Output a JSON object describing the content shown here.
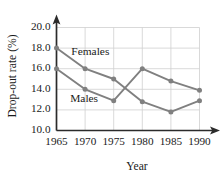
{
  "chart_data": {
    "type": "line",
    "title": "",
    "xlabel": "Year",
    "ylabel": "Drop-out rate (%)",
    "x": [
      1965,
      1970,
      1975,
      1980,
      1985,
      1990
    ],
    "xtick_labels": [
      "1965",
      "1970",
      "1975",
      "1980",
      "1985",
      "1990"
    ],
    "ytick_labels": [
      "10.0",
      "12.0",
      "14.0",
      "16.0",
      "18.0",
      "20.0"
    ],
    "yticks": [
      10.0,
      12.0,
      14.0,
      16.0,
      18.0,
      20.0
    ],
    "xlim": [
      1965,
      1990
    ],
    "ylim": [
      10.0,
      20.0
    ],
    "grid": true,
    "legend_position": "inline-annotations",
    "series": [
      {
        "name": "Females",
        "label": "Females",
        "color": "#808080",
        "values": [
          18.0,
          16.0,
          15.0,
          12.8,
          11.8,
          12.9
        ]
      },
      {
        "name": "Males",
        "label": "Males",
        "color": "#808080",
        "values": [
          16.0,
          14.0,
          12.9,
          16.0,
          14.8,
          13.9
        ]
      }
    ],
    "annotations": [
      {
        "text": "Females",
        "x": 1967.6,
        "y": 17.55
      },
      {
        "text": "Males",
        "x": 1967.4,
        "y": 13.05
      }
    ],
    "colors": {
      "series_line": "#808080",
      "gridline": "#cfcfcf",
      "axis": "#2b2b2b",
      "background": "#ffffff",
      "text": "#1a1a1a"
    }
  }
}
